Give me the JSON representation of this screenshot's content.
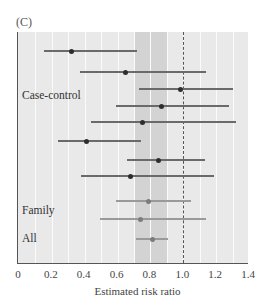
{
  "panel_label": "(C)",
  "chart_data": {
    "type": "forest",
    "title": "",
    "xlabel": "Estimated risk ratio",
    "ylabel": "",
    "xlim": [
      0,
      1.4
    ],
    "xticks": [
      0,
      0.2,
      0.4,
      0.6,
      0.8,
      1.0,
      1.2,
      1.4
    ],
    "xtick_labels": [
      "0",
      "0.2",
      "0.4",
      "0.6",
      "0.8",
      "1.0",
      "1.2",
      "1.4"
    ],
    "grid": "vertical",
    "reference_line": 1.0,
    "shaded_band": [
      0.7,
      0.9
    ],
    "groups": [
      {
        "label": "Case-control",
        "rows": [
          1,
          8
        ]
      },
      {
        "label": "Family",
        "rows": [
          9,
          10
        ]
      },
      {
        "label": "All",
        "rows": [
          11,
          11
        ]
      }
    ],
    "studies": [
      {
        "group": "Case-control",
        "estimate": 0.32,
        "lower": 0.15,
        "upper": 0.72
      },
      {
        "group": "Case-control",
        "estimate": 0.65,
        "lower": 0.37,
        "upper": 1.14
      },
      {
        "group": "Case-control",
        "estimate": 0.98,
        "lower": 0.73,
        "upper": 1.3
      },
      {
        "group": "Case-control",
        "estimate": 0.87,
        "lower": 0.59,
        "upper": 1.28
      },
      {
        "group": "Case-control",
        "estimate": 0.75,
        "lower": 0.44,
        "upper": 1.32
      },
      {
        "group": "Case-control",
        "estimate": 0.41,
        "lower": 0.24,
        "upper": 0.74
      },
      {
        "group": "Case-control",
        "estimate": 0.85,
        "lower": 0.66,
        "upper": 1.13
      },
      {
        "group": "Case-control",
        "estimate": 0.68,
        "lower": 0.38,
        "upper": 1.19
      },
      {
        "group": "Family",
        "estimate": 0.79,
        "lower": 0.59,
        "upper": 1.05
      },
      {
        "group": "Family",
        "estimate": 0.74,
        "lower": 0.49,
        "upper": 1.14
      },
      {
        "group": "All",
        "estimate": 0.81,
        "lower": 0.71,
        "upper": 0.91
      }
    ],
    "colors": {
      "background": "#e9e9e9",
      "band": "#d3d3d3",
      "gridline": "#fbfbfb",
      "point_case_control": "#2e2e2e",
      "point_family_all": "#7c7c7c"
    }
  },
  "layout": {
    "row_y": [
      51,
      72,
      89,
      106,
      122,
      141,
      160,
      176,
      201,
      219,
      239
    ],
    "group_label_y": {
      "Case-control": 97,
      "Family": 212,
      "All": 240
    }
  }
}
